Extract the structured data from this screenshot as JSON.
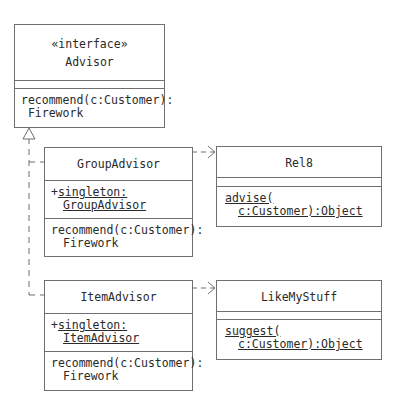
{
  "diagram": {
    "type": "UML class diagram",
    "classes": [
      {
        "id": "advisor",
        "stereotype": "«interface»",
        "name": "Advisor",
        "attributes": [],
        "operations": [
          {
            "line1": "recommend(c:Customer):",
            "line2": " Firework",
            "static": false
          }
        ]
      },
      {
        "id": "group_advisor",
        "name": "GroupAdvisor",
        "attributes": [
          {
            "prefix": "+",
            "line1": "singleton:",
            "line2": "GroupAdvisor",
            "static": true
          }
        ],
        "operations": [
          {
            "line1": "recommend(c:Customer):",
            "line2": "Firework",
            "static": false
          }
        ]
      },
      {
        "id": "rel8",
        "name": "Rel8",
        "attributes": [],
        "operations": [
          {
            "line1": "advise(",
            "line2": "c:Customer):Object",
            "static": true
          }
        ]
      },
      {
        "id": "item_advisor",
        "name": "ItemAdvisor",
        "attributes": [
          {
            "prefix": "+",
            "line1": "singleton:",
            "line2": "ItemAdvisor",
            "static": true
          }
        ],
        "operations": [
          {
            "line1": "recommend(c:Customer):",
            "line2": "Firework",
            "static": false
          }
        ]
      },
      {
        "id": "like_my_stuff",
        "name": "LikeMyStuff",
        "attributes": [],
        "operations": [
          {
            "line1": "suggest(",
            "line2": "c:Customer):Object",
            "static": true
          }
        ]
      }
    ],
    "relationships": [
      {
        "from": "GroupAdvisor",
        "to": "Advisor",
        "kind": "realization"
      },
      {
        "from": "ItemAdvisor",
        "to": "Advisor",
        "kind": "realization"
      },
      {
        "from": "GroupAdvisor",
        "to": "Rel8",
        "kind": "dependency"
      },
      {
        "from": "ItemAdvisor",
        "to": "LikeMyStuff",
        "kind": "dependency"
      }
    ],
    "colors": {
      "line": "#6f6f6f",
      "text": "#2a2a2a",
      "background": "#ffffff"
    }
  }
}
